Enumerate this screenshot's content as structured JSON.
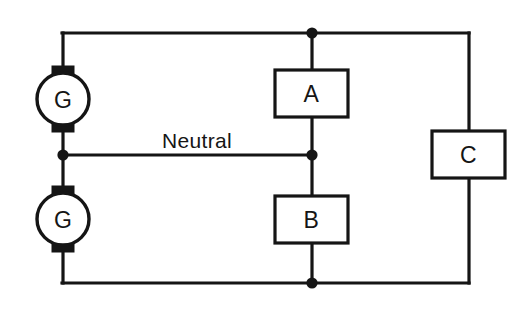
{
  "diagram": {
    "background_color": "#ffffff",
    "line_color": "#151515",
    "generators": [
      {
        "id": "generator-top",
        "label": "G",
        "cx": 63,
        "cy": 99,
        "r": 26
      },
      {
        "id": "generator-bottom",
        "label": "G",
        "cx": 63,
        "cy": 219,
        "r": 26
      }
    ],
    "loads": [
      {
        "id": "load-a",
        "label": "A",
        "x": 275,
        "y": 70,
        "w": 73,
        "h": 47
      },
      {
        "id": "load-b",
        "label": "B",
        "x": 275,
        "y": 196,
        "w": 73,
        "h": 47
      },
      {
        "id": "load-c",
        "label": "C",
        "x": 432,
        "y": 131,
        "w": 73,
        "h": 47
      }
    ],
    "wire_labels": [
      {
        "id": "neutral-label",
        "text": "Neutral",
        "x": 197,
        "y": 148
      }
    ],
    "junction_dots": [
      {
        "id": "node-top-center",
        "cx": 312,
        "cy": 33
      },
      {
        "id": "node-neutral-left",
        "cx": 63,
        "cy": 155
      },
      {
        "id": "node-neutral-center",
        "cx": 312,
        "cy": 155
      },
      {
        "id": "node-bottom-center",
        "cx": 312,
        "cy": 283
      }
    ],
    "conductors": [
      {
        "id": "positive-outer-conductor",
        "path": "M 62 33 L 469 33"
      },
      {
        "id": "negative-outer-conductor",
        "path": "M 62 283 L 469 283"
      },
      {
        "id": "neutral-conductor",
        "path": "M 63 155 L 312 155"
      },
      {
        "id": "top-generator-riser",
        "path": "M 63 33 L 63 73"
      },
      {
        "id": "mid-generator-link",
        "path": "M 63 125 L 63 193"
      },
      {
        "id": "bottom-generator-drop",
        "path": "M 63 245 L 63 283"
      },
      {
        "id": "load-a-upper-lead",
        "path": "M 312 33 L 312 70"
      },
      {
        "id": "load-a-lower-lead",
        "path": "M 312 117 L 312 155"
      },
      {
        "id": "load-b-upper-lead",
        "path": "M 312 155 L 312 196"
      },
      {
        "id": "load-b-lower-lead",
        "path": "M 312 243 L 312 283"
      },
      {
        "id": "load-c-upper-lead",
        "path": "M 469 33 L 469 131"
      },
      {
        "id": "load-c-lower-lead",
        "path": "M 469 178 L 469 283"
      }
    ]
  }
}
